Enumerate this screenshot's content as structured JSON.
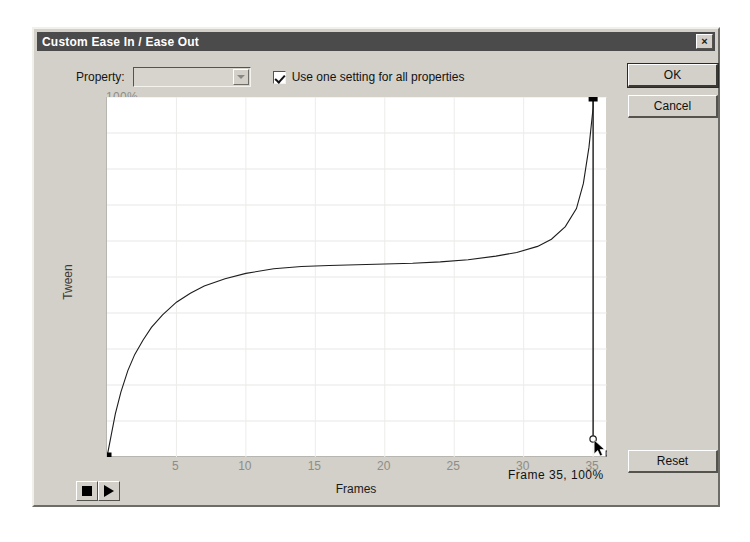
{
  "dialog": {
    "title": "Custom Ease In / Ease Out",
    "close_label": "×"
  },
  "toolbar": {
    "property_label": "Property:",
    "property_value": "",
    "property_placeholder": "",
    "dropdown_icon": "chevron-down-icon",
    "checkbox_label": "Use one setting for all properties",
    "checkbox_checked": true
  },
  "buttons": {
    "ok_label": "OK",
    "cancel_label": "Cancel",
    "reset_label": "Reset"
  },
  "transport": {
    "stop_label": "stop-icon",
    "play_label": "play-icon"
  },
  "graph": {
    "ylabel": "Tween",
    "xlabel": "Frames",
    "readout": "Frame  35,   100%"
  },
  "chart_data": {
    "type": "line",
    "title": "Custom Ease In / Ease Out",
    "xlabel": "Frames",
    "ylabel": "Tween",
    "xlim": [
      0,
      36
    ],
    "ylim": [
      0,
      100
    ],
    "grid": true,
    "legend": false,
    "xticks": [
      5,
      10,
      15,
      20,
      25,
      30,
      35
    ],
    "xticklabels": [
      "5",
      "10",
      "15",
      "20",
      "25",
      "30",
      "35"
    ],
    "yticks": [
      10,
      20,
      30,
      40,
      50,
      60,
      70,
      80,
      90,
      100
    ],
    "yticklabels": [
      "10%",
      "20%",
      "30%",
      "40%",
      "50%",
      "60%",
      "70%",
      "80%",
      "90%",
      "100%"
    ],
    "series": [
      {
        "name": "Ease curve",
        "x": [
          0.0,
          0.3,
          0.6,
          1.0,
          1.5,
          2.0,
          2.6,
          3.2,
          4.0,
          5.0,
          6.0,
          7.0,
          8.5,
          10.0,
          12.0,
          14.0,
          16.0,
          18.0,
          20.0,
          22.0,
          24.0,
          26.0,
          28.0,
          29.5,
          31.0,
          32.0,
          33.0,
          33.8,
          34.3,
          34.7,
          35.0,
          35.0
        ],
        "y": [
          0.0,
          6.0,
          12.0,
          18.0,
          24.0,
          28.5,
          32.5,
          36.0,
          39.5,
          43.0,
          45.5,
          47.5,
          49.5,
          51.0,
          52.3,
          52.9,
          53.2,
          53.4,
          53.6,
          53.8,
          54.2,
          54.8,
          55.8,
          56.8,
          58.5,
          60.5,
          64.0,
          69.0,
          76.0,
          86.0,
          97.0,
          100.0
        ]
      }
    ],
    "anchors": [
      {
        "name": "start-anchor",
        "frame": 0,
        "percent": 0,
        "selected": false
      },
      {
        "name": "end-anchor",
        "frame": 35,
        "percent": 100,
        "selected": true
      }
    ],
    "tangent_handle": {
      "name": "end-tangent-handle",
      "frame": 35,
      "percent": 5
    }
  }
}
